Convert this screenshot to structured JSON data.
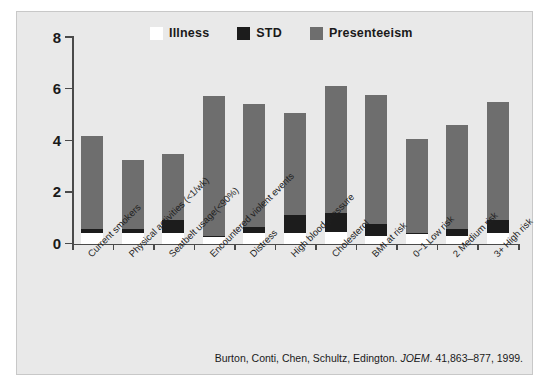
{
  "chart_data": {
    "type": "bar",
    "subtype": "stacked-bar",
    "title": "",
    "xlabel": "",
    "ylabel": "",
    "ylim": [
      0,
      8
    ],
    "yticks": [
      "0",
      "2",
      "4",
      "6",
      "8"
    ],
    "grid": false,
    "legend_position": "top-center",
    "categories": [
      "Current smokers",
      "Physical activities (<1/wk)",
      "Seatbelt usage(<90%)",
      "Encountered violent events",
      "Distress",
      "High blood pressure",
      "Cholesterol",
      "BMI at risk",
      "0~1 Low risk",
      "2 Medium risk",
      "3+ High risk"
    ],
    "series": [
      {
        "name": "Illness",
        "color": "#ffffff",
        "values": [
          0.4,
          0.4,
          0.4,
          0.25,
          0.4,
          0.4,
          0.45,
          0.3,
          0.35,
          0.3,
          0.4
        ]
      },
      {
        "name": "STD",
        "color": "#1c1c1c",
        "values": [
          0.15,
          0.15,
          0.5,
          0.05,
          0.25,
          0.7,
          0.75,
          0.45,
          0.05,
          0.25,
          0.5
        ]
      },
      {
        "name": "Presenteeism",
        "color": "#6e6e6e",
        "values": [
          3.6,
          2.7,
          2.55,
          5.4,
          4.75,
          3.95,
          4.9,
          5.0,
          3.65,
          4.05,
          4.6
        ]
      }
    ],
    "totals": [
      4.15,
      3.25,
      3.45,
      5.7,
      5.4,
      5.05,
      6.1,
      5.75,
      4.05,
      4.6,
      5.5
    ]
  },
  "legend": {
    "items": [
      {
        "label": "Illness",
        "color": "#ffffff"
      },
      {
        "label": "STD",
        "color": "#1c1c1c"
      },
      {
        "label": "Presenteeism",
        "color": "#6e6e6e"
      }
    ]
  },
  "citation": {
    "authors": "Burton, Conti, Chen, Schultz, Edington.",
    "journal": "JOEM",
    "details": ". 41,863–877, 1999."
  },
  "colors": {
    "panel_background": "#e9e9e9",
    "axis": "#4a4a4a",
    "text": "#1a1a1a",
    "illness": "#ffffff",
    "std": "#1c1c1c",
    "presenteeism": "#6e6e6e"
  }
}
